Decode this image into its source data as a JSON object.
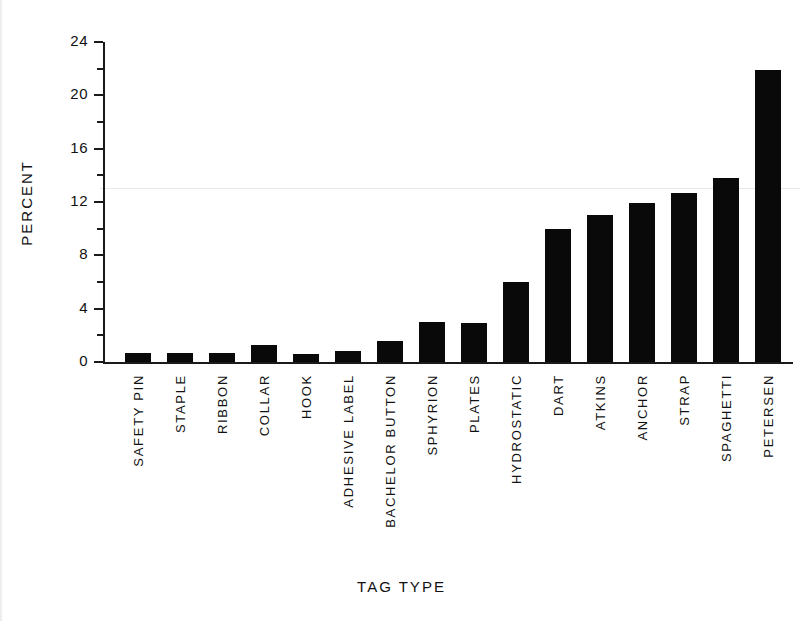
{
  "chart_data": {
    "type": "bar",
    "title": "",
    "xlabel": "TAG   TYPE",
    "ylabel": "PERCENT",
    "ylim": [
      0,
      24
    ],
    "ytick_labels": [
      "0",
      "4",
      "8",
      "12",
      "16",
      "20",
      "24"
    ],
    "ytick_values": [
      0,
      4,
      8,
      12,
      16,
      20,
      24
    ],
    "yminor_values": [
      2,
      6,
      10,
      14,
      18,
      22
    ],
    "grid": false,
    "legend": null,
    "bar_color": "#090909",
    "axis_color": "#1a1a1a",
    "categories": [
      "SAFETY PIN",
      "STAPLE",
      "RIBBON",
      "COLLAR",
      "HOOK",
      "ADHESIVE LABEL",
      "BACHELOR BUTTON",
      "SPHYRION",
      "PLATES",
      "HYDROSTATIC",
      "DART",
      "ATKINS",
      "ANCHOR",
      "STRAP",
      "SPAGHETTI",
      "PETERSEN"
    ],
    "values": [
      0.7,
      0.7,
      0.7,
      1.3,
      0.6,
      0.8,
      1.6,
      3.0,
      2.9,
      6.0,
      10.0,
      11.0,
      11.9,
      12.7,
      13.8,
      21.9
    ]
  },
  "axis": {
    "y_title": "PERCENT",
    "x_title": "TAG   TYPE"
  }
}
